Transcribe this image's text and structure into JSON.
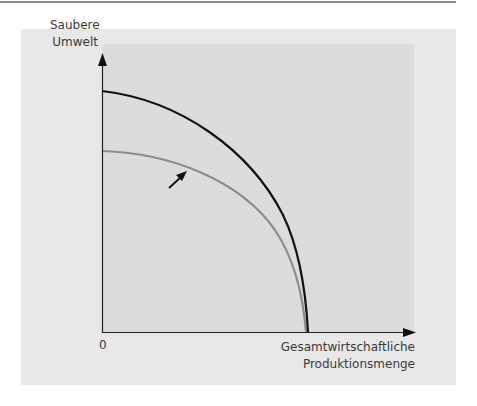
{
  "diagram": {
    "type": "production-possibility-frontier",
    "y_axis_label_line1": "Saubere",
    "y_axis_label_line2": "Umwelt",
    "x_axis_label_line1": "Gesamtwirtschaftliche",
    "x_axis_label_line2": "Produktionsmenge",
    "origin_label": "0",
    "curves": [
      {
        "name": "original-frontier",
        "color": "#8c8c8c",
        "description": "Gray curve (before shift)"
      },
      {
        "name": "shifted-frontier",
        "color": "#111111",
        "description": "Black curve (after shift)"
      }
    ],
    "shift_arrow": {
      "direction": "outward",
      "color": "#111111"
    }
  },
  "colors": {
    "panel_bg": "#e8e8e8",
    "plot_bg": "#dcdcdc",
    "axis": "#222222",
    "text": "#3a3a3a"
  }
}
